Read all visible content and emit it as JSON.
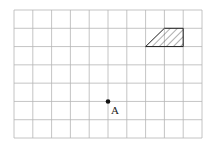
{
  "diagram": {
    "grid": {
      "cols": 10,
      "rows": 7,
      "x0": 14,
      "y0": 10,
      "x1": 202,
      "y1": 138,
      "line_color": "#b5b5b5"
    },
    "shape": {
      "type": "trapezoid",
      "fill": "hatched",
      "points_grid": [
        [
          7,
          2
        ],
        [
          9,
          2
        ],
        [
          9,
          1
        ],
        [
          8,
          1
        ]
      ]
    },
    "point": {
      "label": "A",
      "grid": [
        5,
        5
      ]
    }
  }
}
